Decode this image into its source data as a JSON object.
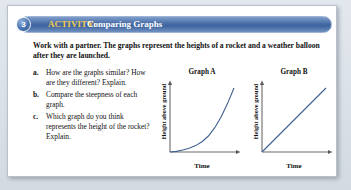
{
  "page": {
    "background_color": "#d9dfe6",
    "card_color": "#ffffff"
  },
  "activity": {
    "number": "3",
    "kicker": "ACTIVITY:",
    "title": "Comparing Graphs",
    "bar_color": "#4a6fa8",
    "kicker_color": "#f2c94c",
    "title_color": "#ffffff"
  },
  "intro": {
    "text": "Work with a partner. The graphs represent the heights of a rocket and a weather balloon after they are launched."
  },
  "questions": [
    {
      "letter": "a.",
      "text": "How are the graphs similar? How are they different? Explain."
    },
    {
      "letter": "b.",
      "text": "Compare the steepness of each graph."
    },
    {
      "letter": "c.",
      "text": "Which graph do you think represents the height of the rocket? Explain."
    }
  ],
  "chart_data": [
    {
      "type": "line",
      "title": "Graph A",
      "xlabel": "Time",
      "ylabel": "Height above ground",
      "grid": false,
      "legend": "none",
      "axis_ticks": false,
      "xlim": [
        0,
        1
      ],
      "ylim": [
        0,
        1
      ],
      "series": [
        {
          "name": "Graph A curve",
          "shape": "exponential increasing (concave up)",
          "line_color": "#3f5f8f",
          "x": [
            0.0,
            0.1,
            0.2,
            0.3,
            0.4,
            0.5,
            0.6,
            0.7,
            0.8,
            0.9,
            1.0
          ],
          "y": [
            0.0,
            0.01,
            0.03,
            0.06,
            0.1,
            0.16,
            0.25,
            0.38,
            0.55,
            0.76,
            1.0
          ]
        }
      ]
    },
    {
      "type": "line",
      "title": "Graph B",
      "xlabel": "Time",
      "ylabel": "Height above ground",
      "grid": false,
      "legend": "none",
      "axis_ticks": false,
      "xlim": [
        0,
        1
      ],
      "ylim": [
        0,
        1
      ],
      "series": [
        {
          "name": "Graph B line",
          "shape": "linear increasing (constant slope)",
          "line_color": "#3f5f8f",
          "x": [
            0.0,
            0.25,
            0.5,
            0.75,
            1.0
          ],
          "y": [
            0.0,
            0.25,
            0.5,
            0.75,
            1.0
          ]
        }
      ]
    }
  ]
}
